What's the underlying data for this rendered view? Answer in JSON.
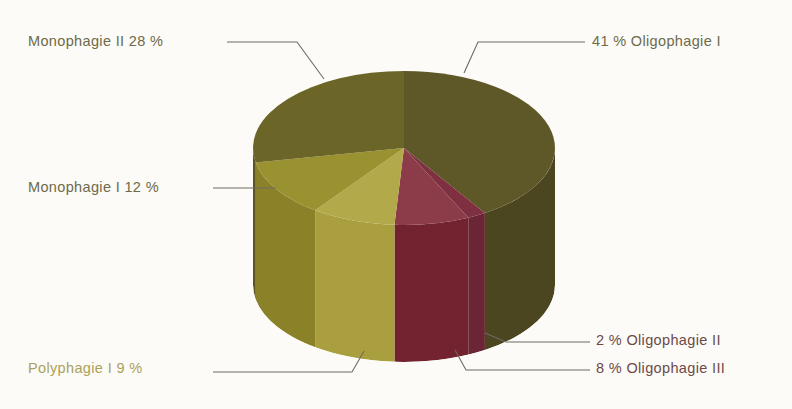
{
  "chart_data": {
    "type": "pie",
    "title": "",
    "subtitle": "",
    "xlabel": "",
    "ylabel": "",
    "style": "3d-cylinder-pie",
    "legend_position": "callout-labels",
    "grid": false,
    "unit": "%",
    "categories": [
      "Oligophagie I",
      "Oligophagie II",
      "Oligophagie III",
      "Polyphagie I",
      "Monophagie I",
      "Monophagie II"
    ],
    "values": [
      41,
      2,
      8,
      9,
      12,
      28
    ],
    "slices": [
      {
        "name": "Oligophagie I",
        "value": 41,
        "value_label": "41 %",
        "label_text": "41 %  Oligophagie I",
        "color_top": "#5e5727",
        "color_side": "#4c4620",
        "label_color": "#6d6a4a"
      },
      {
        "name": "Oligophagie II",
        "value": 2,
        "value_label": "2 %",
        "label_text": "2 %  Oligophagie II",
        "color_top": "#7e3040",
        "color_side": "#6a2634",
        "label_color": "#6b4a48"
      },
      {
        "name": "Oligophagie III",
        "value": 8,
        "value_label": "8 %",
        "label_text": "8 %  Oligophagie III",
        "color_top": "#8c3b48",
        "color_side": "#73222f",
        "label_color": "#6b4a48"
      },
      {
        "name": "Polyphagie I",
        "value": 9,
        "value_label": "9 %",
        "label_text": "Polyphagie I  9 %",
        "color_top": "#b2a94b",
        "color_side": "#a99f3e",
        "label_color": "#a9a25c"
      },
      {
        "name": "Monophagie I",
        "value": 12,
        "value_label": "12 %",
        "label_text": "Monophagie I  12 %",
        "color_top": "#9a9130",
        "color_side": "#8a8129",
        "label_color": "#6d6a4a"
      },
      {
        "name": "Monophagie II",
        "value": 28,
        "value_label": "28 %",
        "label_text": "Monophagie II  28 %",
        "color_top": "#6b6528",
        "color_side": "#5a5422",
        "label_color": "#6d6a4a"
      }
    ]
  },
  "labels": {
    "monophagie_2": "Monophagie II  28 %",
    "oligophagie_1": "41 %  Oligophagie I",
    "monophagie_1": "Monophagie I  12 %",
    "polyphagie_1": "Polyphagie I  9 %",
    "oligophagie_2": "2 %  Oligophagie II",
    "oligophagie_3": "8 %  Oligophagie III"
  },
  "colors": {
    "background": "#fcfbf7",
    "leader_line": "#6e6a62",
    "label_olive": "#6d6a4a",
    "label_yellow": "#a9a25c",
    "label_maroon": "#6b4a48"
  }
}
